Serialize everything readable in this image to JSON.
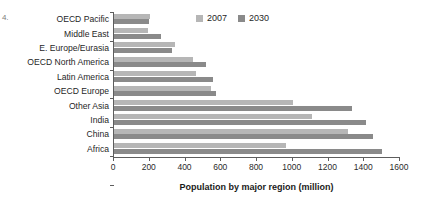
{
  "page_marker": "4.",
  "chart_data": {
    "type": "bar",
    "orientation": "horizontal",
    "title": "",
    "xlabel": "Population by major region (million)",
    "ylabel": "",
    "xlim": [
      0,
      1600
    ],
    "xticks": [
      0,
      200,
      400,
      600,
      800,
      1000,
      1200,
      1400,
      1600
    ],
    "grid": false,
    "legend_position": "top-center",
    "categories": [
      "OECD Pacific",
      "Middle East",
      "E. Europe/Eurasia",
      "OECD North America",
      "Latin America",
      "OECD Europe",
      "Other Asia",
      "India",
      "China",
      "Africa"
    ],
    "series": [
      {
        "name": "2007",
        "color": "#b6b6b6",
        "values": [
          200,
          190,
          340,
          440,
          460,
          540,
          1000,
          1110,
          1310,
          960
        ]
      },
      {
        "name": "2030",
        "color": "#8a8a8a",
        "values": [
          195,
          265,
          325,
          515,
          555,
          570,
          1330,
          1410,
          1450,
          1500
        ]
      }
    ]
  }
}
